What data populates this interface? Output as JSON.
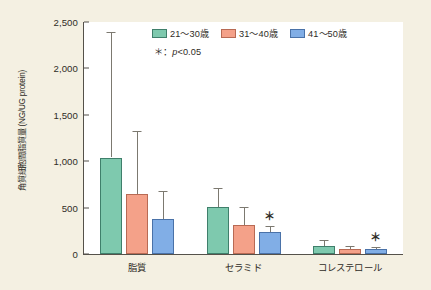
{
  "chart_data": {
    "type": "bar",
    "title": "",
    "xlabel": "",
    "ylabel": "角質細胞間脂質量 (NG/UG protein)",
    "ylim": [
      0,
      2500
    ],
    "yticks": [
      0,
      500,
      1000,
      1500,
      2000,
      2500
    ],
    "ytick_labels": [
      "0",
      "500",
      "1,000",
      "1,500",
      "2,000",
      "2,500"
    ],
    "grid": false,
    "legend_position": "top-right",
    "categories": [
      "脂質",
      "セラミド",
      "コレステロール"
    ],
    "series": [
      {
        "name": "21～30歳",
        "color": "#7ec9ae",
        "edge_color": "#3f7f6b",
        "values": [
          1040,
          510,
          85
        ],
        "errors": [
          1350,
          200,
          65
        ],
        "significant": [
          false,
          false,
          false
        ]
      },
      {
        "name": "31～40歳",
        "color": "#f4a189",
        "edge_color": "#b86a54",
        "values": [
          650,
          310,
          55
        ],
        "errors": [
          680,
          200,
          30
        ],
        "significant": [
          false,
          false,
          false
        ]
      },
      {
        "name": "41～50歳",
        "color": "#81aee6",
        "edge_color": "#4a72a8",
        "values": [
          380,
          240,
          50
        ],
        "errors": [
          300,
          60,
          25
        ],
        "significant": [
          false,
          true,
          true
        ]
      }
    ],
    "significance_note": "＊：p<0.05",
    "significance_marker": "＊"
  },
  "legend": {
    "items": [
      {
        "label": "21～30歳"
      },
      {
        "label": "31～40歳"
      },
      {
        "label": "41～50歳"
      }
    ],
    "note_prefix": "＊：",
    "note_italic": "p",
    "note_suffix": "<0.05"
  }
}
